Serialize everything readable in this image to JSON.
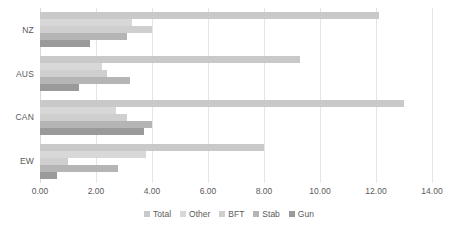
{
  "chart_data": {
    "type": "bar",
    "orientation": "horizontal",
    "title": "",
    "xlabel": "",
    "ylabel": "",
    "xlim": [
      0.0,
      14.0
    ],
    "xticks": [
      "0.00",
      "2.00",
      "4.00",
      "6.00",
      "8.00",
      "10.00",
      "12.00",
      "14.00"
    ],
    "xtick_values": [
      0,
      2,
      4,
      6,
      8,
      10,
      12,
      14
    ],
    "grid": true,
    "legend_position": "bottom",
    "categories": [
      "NZ",
      "AUS",
      "CAN",
      "EW"
    ],
    "series": [
      {
        "name": "Total",
        "color": "#c9c9c9",
        "values": [
          12.1,
          9.3,
          13.0,
          8.0
        ]
      },
      {
        "name": "Other",
        "color": "#d8d8d8",
        "values": [
          3.3,
          2.2,
          2.7,
          3.8
        ]
      },
      {
        "name": "BFT",
        "color": "#cfcfcf",
        "values": [
          4.0,
          2.4,
          3.1,
          1.0
        ]
      },
      {
        "name": "Stab",
        "color": "#b5b5b5",
        "values": [
          3.1,
          3.2,
          4.0,
          2.8
        ]
      },
      {
        "name": "Gun",
        "color": "#9a9a9a",
        "values": [
          1.8,
          1.4,
          3.7,
          0.6
        ]
      }
    ]
  },
  "axis": {
    "tick_color": "#5a5a5a",
    "grid_color": "#e4e4e4"
  }
}
